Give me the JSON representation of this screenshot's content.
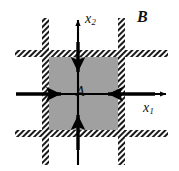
{
  "figure": {
    "type": "technical-diagram",
    "width": 179,
    "height": 171,
    "background_color": "#ffffff"
  },
  "labels": {
    "outer_region": "B",
    "inner_region": "A",
    "axis_vertical": "x",
    "axis_vertical_sub": "2",
    "axis_horizontal": "x",
    "axis_horizontal_sub": "1"
  },
  "colors": {
    "region_fill": "#a0a0a0",
    "hatch_line": "#1a1a1a",
    "hatch_background": "#ffffff",
    "stroke": "#000000",
    "text": "#111111",
    "canvas": "#ffffff"
  },
  "geometry": {
    "region_a": {
      "x": 47,
      "y": 56,
      "width": 75,
      "height": 76
    },
    "band_thickness": 8,
    "band_left_x": 42,
    "band_right_x": 118,
    "band_top_y": 50,
    "band_bottom_y": 130,
    "band_vertical_top": 18,
    "band_vertical_bottom": 165,
    "band_horizontal_left": 15,
    "band_horizontal_right": 168,
    "axis_x_y": 94,
    "axis_y_x": 78
  },
  "arrows": {
    "axis": [
      {
        "name": "x2-axis-arrow",
        "direction": "up",
        "from": [
          78,
          165
        ],
        "to": [
          78,
          18
        ]
      },
      {
        "name": "x1-axis-arrow",
        "direction": "right",
        "from": [
          18,
          94
        ],
        "to": [
          168,
          94
        ]
      }
    ],
    "inward_load": [
      {
        "name": "load-arrow-top",
        "direction": "down",
        "from": [
          78,
          45
        ],
        "to": [
          78,
          74
        ]
      },
      {
        "name": "load-arrow-bottom",
        "direction": "up",
        "from": [
          78,
          146
        ],
        "to": [
          78,
          113
        ]
      },
      {
        "name": "load-arrow-left",
        "direction": "right",
        "from": [
          18,
          94
        ],
        "to": [
          62,
          94
        ]
      },
      {
        "name": "load-arrow-right",
        "direction": "left",
        "from": [
          152,
          94
        ],
        "to": [
          107,
          94
        ]
      }
    ]
  }
}
